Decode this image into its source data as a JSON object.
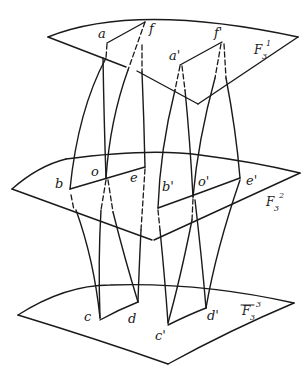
{
  "figure": {
    "sheets": [
      {
        "id": "top",
        "label": "F",
        "subscript": "3",
        "superscript": "1"
      },
      {
        "id": "middle",
        "label": "F",
        "subscript": "3",
        "superscript": "2"
      },
      {
        "id": "bottom",
        "label": "F",
        "subscript": "3",
        "superscript": "3"
      }
    ],
    "points": {
      "top": [
        "a",
        "f",
        "a'",
        "f'"
      ],
      "middle": [
        "b",
        "o",
        "e",
        "b'",
        "o'",
        "e'"
      ],
      "bottom": [
        "c",
        "d",
        "c'",
        "d'"
      ]
    },
    "labels": {
      "a": "a",
      "f": "f",
      "a_prime": "a'",
      "f_prime": "f'",
      "b": "b",
      "o": "o",
      "e": "e",
      "b_prime": "b'",
      "o_prime": "o'",
      "e_prime": "e'",
      "c": "c",
      "d": "d",
      "c_prime": "c'",
      "d_prime": "d'"
    }
  }
}
